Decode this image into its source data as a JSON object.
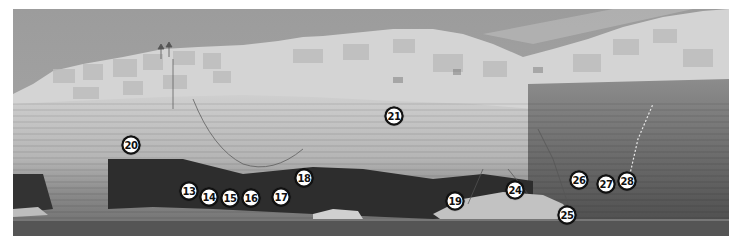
{
  "image": {
    "subject": "sea-cliff-climbing-topo",
    "style": "black-and-white photograph",
    "frame": {
      "x": 13,
      "y": 9,
      "width": 716,
      "height": 227
    }
  },
  "colors": {
    "sky": "#9a9a9a",
    "rock_light": "#d8d8d8",
    "rock_mid": "#a8a8a8",
    "cave_dark": "#2a2a2a",
    "sea": "#555555",
    "marker_fill": "#ffffff",
    "marker_border": "#111111"
  },
  "route_markers": [
    {
      "label": "20",
      "x": 131,
      "y": 145
    },
    {
      "label": "21",
      "x": 394,
      "y": 116
    },
    {
      "label": "13",
      "x": 189,
      "y": 191
    },
    {
      "label": "14",
      "x": 209,
      "y": 197
    },
    {
      "label": "15",
      "x": 230,
      "y": 198
    },
    {
      "label": "16",
      "x": 251,
      "y": 198
    },
    {
      "label": "17",
      "x": 281,
      "y": 197
    },
    {
      "label": "18",
      "x": 304,
      "y": 178
    },
    {
      "label": "19",
      "x": 455,
      "y": 201
    },
    {
      "label": "24",
      "x": 515,
      "y": 190
    },
    {
      "label": "25",
      "x": 567,
      "y": 215
    },
    {
      "label": "26",
      "x": 579,
      "y": 180
    },
    {
      "label": "27",
      "x": 606,
      "y": 184
    },
    {
      "label": "28",
      "x": 627,
      "y": 181
    }
  ]
}
